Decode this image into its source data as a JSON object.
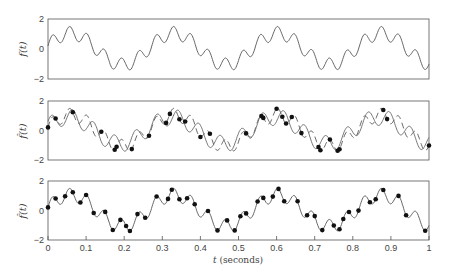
{
  "chart_data": [
    {
      "type": "line",
      "panel": "top",
      "ylabel": "f(t)",
      "ylim": [
        -2,
        2
      ],
      "yticks": [
        "2",
        "0",
        "-2"
      ],
      "xlim": [
        0,
        1
      ],
      "series": [
        {
          "name": "f(t)",
          "style": "solid",
          "description": "original signal, periodic with period ~0.27 s, slow oscillation plus fast ripple"
        }
      ]
    },
    {
      "type": "line",
      "panel": "middle",
      "ylabel": "f̂(t)",
      "ylim": [
        -2,
        2
      ],
      "yticks": [
        "2",
        "0",
        "-2"
      ],
      "xlim": [
        0,
        1
      ],
      "series": [
        {
          "name": "reconstruction",
          "style": "solid"
        },
        {
          "name": "original f(t)",
          "style": "dashed"
        },
        {
          "name": "samples",
          "style": "markers",
          "count": 30
        }
      ]
    },
    {
      "type": "line",
      "panel": "bottom",
      "ylabel": "f̂(t)",
      "ylim": [
        -2,
        2
      ],
      "yticks": [
        "2",
        "0",
        "-2"
      ],
      "xlim": [
        0,
        1
      ],
      "xticks": [
        "0",
        "0.1",
        "0.2",
        "0.3",
        "0.4",
        "0.5",
        "0.6",
        "0.7",
        "0.8",
        "0.9",
        "1"
      ],
      "xlabel": "t (seconds)",
      "series": [
        {
          "name": "reconstruction",
          "style": "solid"
        },
        {
          "name": "samples",
          "style": "markers",
          "count": 44
        }
      ]
    }
  ],
  "labels": {
    "top_ylabel": "f(t)",
    "mid_ylabel": "f̂(t)",
    "bot_ylabel": "f̂(t)",
    "xlabel_t": "t",
    "xlabel_unit": "(seconds)",
    "ytick_top": "2",
    "ytick_mid": "0",
    "ytick_bot": "−2",
    "xticks": [
      "0",
      "0.1",
      "0.2",
      "0.3",
      "0.4",
      "0.5",
      "0.6",
      "0.7",
      "0.8",
      "0.9",
      "1"
    ]
  },
  "colors": {
    "axis": "#555555",
    "line": "#555555",
    "marker": "#111111"
  },
  "signal": {
    "period": 0.272,
    "slow_amp": 1.05,
    "slow_phase": 0.2,
    "fast_freq": 22.0,
    "fast_amp": 0.45,
    "fast_phase": 0.0
  },
  "mid_samples_t": [
    0.0,
    0.02,
    0.065,
    0.14,
    0.175,
    0.18,
    0.22,
    0.265,
    0.31,
    0.32,
    0.345,
    0.36,
    0.4,
    0.425,
    0.52,
    0.56,
    0.565,
    0.6,
    0.615,
    0.625,
    0.64,
    0.665,
    0.71,
    0.715,
    0.74,
    0.76,
    0.765,
    0.88,
    0.89,
    1.0
  ],
  "bot_samples_t": [
    0.0,
    0.02,
    0.045,
    0.065,
    0.085,
    0.1,
    0.12,
    0.15,
    0.17,
    0.19,
    0.205,
    0.215,
    0.235,
    0.255,
    0.285,
    0.315,
    0.325,
    0.345,
    0.365,
    0.385,
    0.42,
    0.445,
    0.47,
    0.49,
    0.505,
    0.52,
    0.55,
    0.565,
    0.59,
    0.605,
    0.62,
    0.655,
    0.68,
    0.7,
    0.72,
    0.75,
    0.765,
    0.775,
    0.79,
    0.815,
    0.845,
    0.86,
    0.88,
    0.92,
    0.94,
    0.99
  ]
}
